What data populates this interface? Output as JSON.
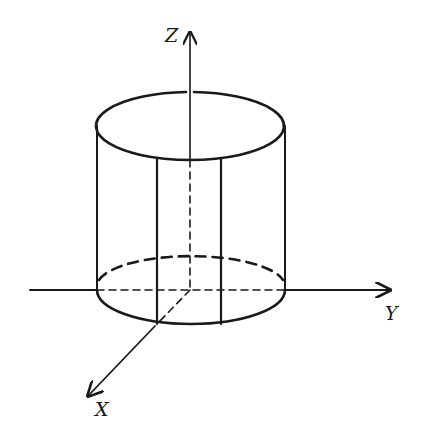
{
  "diagram": {
    "type": "3D cylinder with coordinate axes",
    "axes": {
      "z_label": "Z",
      "y_label": "Y",
      "x_label": "X"
    },
    "colors": {
      "stroke": "#1a1a1a",
      "background": "#ffffff"
    }
  }
}
